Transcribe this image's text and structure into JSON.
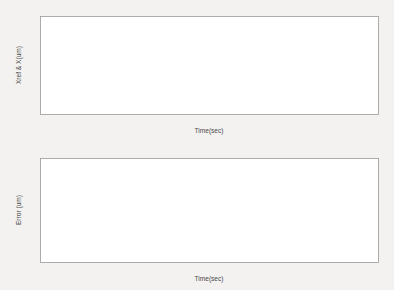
{
  "figure": {
    "background_color": "#f3f2f1",
    "axes_background_color": "#ffffff",
    "line_color": "#5b5b5b",
    "axis_color": "#9a9a9a"
  },
  "chart_data": [
    {
      "type": "line",
      "id": "position-tracking",
      "title": "",
      "xlabel": "Time(sec)",
      "ylabel": "Xref & X(um)",
      "xlim": [
        0,
        2
      ],
      "ylim": [
        -60,
        60
      ],
      "xticks": [
        0,
        0.2,
        0.4,
        0.6,
        0.8,
        1,
        1.2,
        1.4,
        1.6,
        1.8,
        2
      ],
      "xticklabels": [
        "0",
        "0.2",
        "0.4",
        "0.6",
        "0.8",
        "1",
        "1.2",
        "1.4",
        "1.6",
        "1.8",
        "2"
      ],
      "yticks": [
        -60,
        -40,
        -20,
        0,
        20,
        40,
        60
      ],
      "yticklabels": [
        "-60",
        "-40",
        "-20",
        "0",
        "20",
        "40",
        "60"
      ],
      "grid": false,
      "legend": null,
      "series": [
        {
          "name": "Xref & X",
          "description": "Sinusoidal reference trajectory, amplitude 50 um, frequency 2 Hz, starting at about -40 um at t=0, peaks of +50 um at t = 0.2, 0.7, 1.2, 1.7 s and troughs of -50 um at t = 0.45, 0.95, 1.45, 1.95 s",
          "amplitude": 50,
          "frequency_hz": 2,
          "phase_deg": -53,
          "offset": 0,
          "x": [
            0,
            0.05,
            0.1,
            0.15,
            0.2,
            0.25,
            0.3,
            0.35,
            0.4,
            0.45,
            0.5,
            0.55,
            0.6,
            0.65,
            0.7,
            0.75,
            0.8,
            0.85,
            0.9,
            0.95,
            1,
            1.05,
            1.1,
            1.15,
            1.2,
            1.25,
            1.3,
            1.35,
            1.4,
            1.45,
            1.5,
            1.55,
            1.6,
            1.65,
            1.7,
            1.75,
            1.8,
            1.85,
            1.9,
            1.95,
            2
          ],
          "y": [
            -40,
            -9,
            21,
            43,
            50,
            43,
            21,
            -9,
            -37,
            -50,
            -47,
            -29,
            -2,
            28,
            50,
            49,
            31,
            3,
            -28,
            -49,
            -50,
            -33,
            -6,
            24,
            49,
            50,
            34,
            8,
            -22,
            -48,
            -50,
            -37,
            -11,
            20,
            47,
            50,
            38,
            13,
            -17,
            -46,
            -35
          ]
        }
      ]
    },
    {
      "type": "line",
      "id": "tracking-error",
      "title": "",
      "xlabel": "Time(sec)",
      "ylabel": "Error (um)",
      "xlim": [
        0,
        2
      ],
      "ylim": [
        -15,
        15
      ],
      "xticks": [
        0,
        0.2,
        0.4,
        0.6,
        0.8,
        1,
        1.2,
        1.4,
        1.6,
        1.8,
        2
      ],
      "xticklabels": [
        "0",
        "0.2",
        "0.4",
        "0.6",
        "0.8",
        "1",
        "1.2",
        "1.4",
        "1.6",
        "1.8",
        "2"
      ],
      "yticks": [
        -15,
        -10,
        -5,
        0,
        5,
        10,
        15
      ],
      "yticklabels": [
        "-15",
        "-10",
        "-5",
        "0",
        "5",
        "10",
        "15"
      ],
      "grid": false,
      "legend": null,
      "series": [
        {
          "name": "Error",
          "description": "Tracking error mostly within +/-1 um, with upward transient spikes to about +4 um at the trajectory peaks (t = 0.21, 0.71, 1.21, 1.71 s) and downward transient spikes to about -4.5 um at the trajectory troughs (t = 0.45, 0.95, 1.45, 1.95 s), plus small high-frequency ripple segments between events",
          "baseline_range": [
            -1.2,
            0.8
          ],
          "positive_spike_times": [
            0.21,
            0.71,
            1.21,
            1.71
          ],
          "positive_spike_values": [
            3.9,
            4.2,
            3.7,
            3.9
          ],
          "negative_spike_times": [
            0.45,
            0.95,
            1.45,
            1.95
          ],
          "negative_spike_values": [
            -4.1,
            -4.4,
            -4.6,
            -4.3
          ]
        }
      ]
    }
  ]
}
